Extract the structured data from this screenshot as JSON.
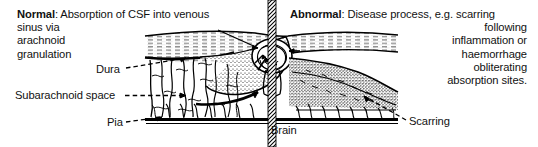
{
  "figure": {
    "background_color": "#ffffff",
    "ink_color": "#000000"
  },
  "normal_caption": {
    "lead_label": "Normal",
    "lead_separator": ":",
    "lines": [
      " Absorption of CSF into venous",
      "sinus via",
      "arachnoid",
      "granulation"
    ]
  },
  "abnormal_caption": {
    "lead_label": "Abnormal",
    "lead_separator": ":",
    "lines": [
      " Disease process, e.g. scarring",
      "following",
      "inflammation or",
      "haemorrhage",
      "obliterating",
      "absorption sites."
    ]
  },
  "labels": {
    "dura": "Dura",
    "subarachnoid_space": "Subarachnoid space",
    "pia": "Pia",
    "brain": "Brain",
    "scarring": "Scarring"
  },
  "anatomy": {
    "divider_name": "midline-hatched-band",
    "structures": [
      "dura-layer",
      "venous-sinus",
      "arachnoid-granulation",
      "subarachnoid-trabeculae",
      "pia-layer",
      "brain-surface",
      "scar-tissue"
    ],
    "flow_arrows": "csf-flow-arrows"
  }
}
